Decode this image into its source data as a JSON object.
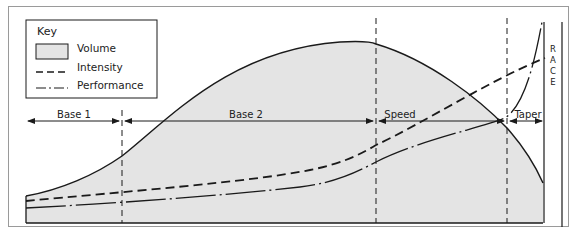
{
  "diagram": {
    "key": {
      "title": "Key",
      "items": [
        {
          "label": "Volume",
          "style": "shaded-area"
        },
        {
          "label": "Intensity",
          "style": "dashed"
        },
        {
          "label": "Performance",
          "style": "dash-dot"
        }
      ]
    },
    "phases": [
      {
        "label": "Base 1"
      },
      {
        "label": "Base 2"
      },
      {
        "label": "Speed"
      },
      {
        "label": "Taper"
      }
    ],
    "race": [
      "R",
      "A",
      "C",
      "E"
    ],
    "colors": {
      "fill": "#e4e4e4",
      "line": "#1a1a1a",
      "frame": "#9a9a9a"
    }
  }
}
